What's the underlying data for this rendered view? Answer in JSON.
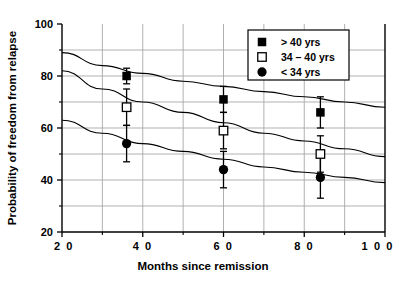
{
  "chart_data": {
    "type": "scatter",
    "title": "",
    "xlabel": "Months since remission",
    "ylabel": "Probability of freedom from relapse",
    "xlim": [
      20,
      100
    ],
    "ylim": [
      20,
      100
    ],
    "xticks": [
      20,
      40,
      60,
      80,
      100
    ],
    "xtick_labels": [
      "2 0",
      "4 0",
      "6 0",
      "8 0",
      "1 0 0"
    ],
    "yticks": [
      20,
      40,
      60,
      80,
      100
    ],
    "ytick_labels": [
      "20",
      "40",
      "60",
      "80",
      "100"
    ],
    "minor_yticks": [
      30,
      50,
      70,
      90
    ],
    "minor_xticks": [
      30,
      50,
      70,
      90
    ],
    "grid": true,
    "legend_position": "top-right",
    "series": [
      {
        "name": "> 40 yrs",
        "marker": "filled-square",
        "points": [
          {
            "x": 36,
            "y": 80,
            "err_low": 77,
            "err_high": 83
          },
          {
            "x": 60,
            "y": 71,
            "err_low": 66,
            "err_high": 76
          },
          {
            "x": 84,
            "y": 66,
            "err_low": 60,
            "err_high": 72
          }
        ],
        "curve": [
          {
            "x": 20,
            "y": 89
          },
          {
            "x": 30,
            "y": 84
          },
          {
            "x": 40,
            "y": 81
          },
          {
            "x": 50,
            "y": 78
          },
          {
            "x": 60,
            "y": 76
          },
          {
            "x": 70,
            "y": 74
          },
          {
            "x": 80,
            "y": 72
          },
          {
            "x": 90,
            "y": 70
          },
          {
            "x": 100,
            "y": 68
          }
        ]
      },
      {
        "name": "34 – 40 yrs",
        "marker": "open-square",
        "points": [
          {
            "x": 36,
            "y": 68,
            "err_low": 61,
            "err_high": 75
          },
          {
            "x": 60,
            "y": 59,
            "err_low": 52,
            "err_high": 66
          },
          {
            "x": 84,
            "y": 50,
            "err_low": 43,
            "err_high": 57
          }
        ],
        "curve": [
          {
            "x": 20,
            "y": 82
          },
          {
            "x": 30,
            "y": 75
          },
          {
            "x": 40,
            "y": 70
          },
          {
            "x": 50,
            "y": 66
          },
          {
            "x": 60,
            "y": 62
          },
          {
            "x": 70,
            "y": 58
          },
          {
            "x": 80,
            "y": 55
          },
          {
            "x": 90,
            "y": 52
          },
          {
            "x": 100,
            "y": 49
          }
        ]
      },
      {
        "name": "< 34 yrs",
        "marker": "filled-circle",
        "points": [
          {
            "x": 36,
            "y": 54,
            "err_low": 47,
            "err_high": 61
          },
          {
            "x": 60,
            "y": 44,
            "err_low": 37,
            "err_high": 51
          },
          {
            "x": 84,
            "y": 41,
            "err_low": 33,
            "err_high": 49
          }
        ],
        "curve": [
          {
            "x": 20,
            "y": 63
          },
          {
            "x": 30,
            "y": 58
          },
          {
            "x": 40,
            "y": 54
          },
          {
            "x": 50,
            "y": 51
          },
          {
            "x": 60,
            "y": 48
          },
          {
            "x": 70,
            "y": 45
          },
          {
            "x": 80,
            "y": 43
          },
          {
            "x": 90,
            "y": 41
          },
          {
            "x": 100,
            "y": 39
          }
        ]
      }
    ]
  },
  "legend": {
    "items": [
      {
        "marker": "filled-square",
        "label": "> 40 yrs"
      },
      {
        "marker": "open-square",
        "label": "34 – 40 yrs"
      },
      {
        "marker": "filled-circle",
        "label": "< 34 yrs"
      }
    ]
  },
  "colors": {
    "axis": "#000000",
    "grid": "#a8a8a8",
    "marker": "#000000",
    "background": "#ffffff"
  }
}
